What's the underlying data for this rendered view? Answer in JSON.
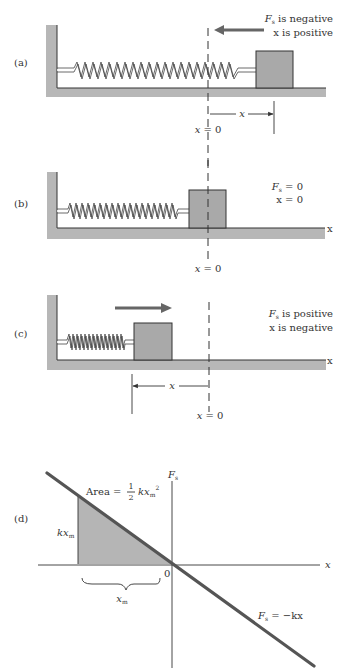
{
  "figure": {
    "colors": {
      "wall_fill": "#b7b7b7",
      "block_fill": "#a9a9a9",
      "arrow": "#666666",
      "line": "#555555",
      "shaded_area": "#b5b5b5",
      "ink": "#333333"
    }
  },
  "panels": [
    {
      "label": "(a)",
      "status_line1_symbol": "F",
      "status_line1_sub": "s",
      "status_line1_text": " is negative",
      "status_line2": "x is positive",
      "force_arrow": "left",
      "origin_label": "x = 0",
      "displacement_label": "x",
      "axis_label": ""
    },
    {
      "label": "(b)",
      "status_line1_symbol": "F",
      "status_line1_sub": "s",
      "status_line1_text": " = 0",
      "status_line2": "x = 0",
      "force_arrow": "none",
      "origin_label": "x = 0",
      "axis_label": "x"
    },
    {
      "label": "(c)",
      "status_line1_symbol": "F",
      "status_line1_sub": "s",
      "status_line1_text": " is positive",
      "status_line2": "x is negative",
      "force_arrow": "right",
      "origin_label": "x = 0",
      "displacement_label": "x",
      "axis_label": "x"
    },
    {
      "label": "(d)",
      "y_axis_symbol": "F",
      "y_axis_sub": "s",
      "x_axis_label": "x",
      "origin_label": "0",
      "area_label_prefix": "Area = ",
      "area_fraction_num": "1",
      "area_fraction_den": "2",
      "area_label_term": "kx",
      "area_label_sub": "m",
      "area_label_sup": "2",
      "height_label": "kx",
      "height_label_sub": "m",
      "width_label": "x",
      "width_label_sub": "m",
      "line_eq_symbol": "F",
      "line_eq_sub": "s",
      "line_eq_text": " = −kx"
    }
  ]
}
